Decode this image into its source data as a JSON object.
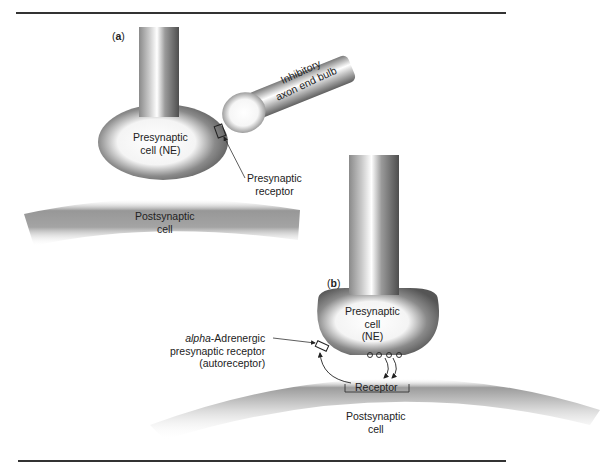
{
  "figure": {
    "panel_a": {
      "panel_label_open": "(",
      "panel_letter": "a",
      "panel_label_close": ")",
      "presynaptic_line1": "Presynaptic",
      "presynaptic_line2": "cell (NE)",
      "inhibitory_line1": "Inhibitory",
      "inhibitory_line2": "axon end bulb",
      "receptor_line1": "Presynaptic",
      "receptor_line2": "receptor",
      "postsynaptic_line1": "Postsynaptic",
      "postsynaptic_line2": "cell"
    },
    "panel_b": {
      "panel_label_open": "(",
      "panel_letter": "b",
      "panel_label_close": ")",
      "presynaptic_line1": "Presynaptic",
      "presynaptic_line2": "cell",
      "presynaptic_line3": "(NE)",
      "autoreceptor_italic": "alpha",
      "autoreceptor_line1_rest": "-Adrenergic",
      "autoreceptor_line2": "presynaptic receptor",
      "autoreceptor_line3": "(autoreceptor)",
      "receptor_label": "Receptor",
      "postsynaptic_line1": "Postsynaptic",
      "postsynaptic_line2": "cell"
    },
    "colors": {
      "ink": "#222222",
      "cell_dark": "#5a5a5a",
      "cell_light": "#ffffff"
    }
  }
}
